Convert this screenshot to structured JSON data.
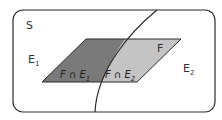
{
  "diagram": {
    "type": "venn-partition",
    "sample_space_label": "S",
    "regions": {
      "e1": {
        "label": "E",
        "subscript": "1"
      },
      "e2": {
        "label": "E",
        "subscript": "2"
      },
      "f": {
        "label": "F"
      }
    },
    "intersections": [
      {
        "label": "F ∩ E",
        "subscript": "1",
        "fill": "#7a7a7a"
      },
      {
        "label": "F ∩ E",
        "subscript": "2",
        "fill": "#c4c4c4"
      }
    ],
    "colors": {
      "border": "#2b2b2b",
      "background": "#ffffff",
      "dark_region": "#7a7a7a",
      "light_region": "#c4c4c4"
    }
  }
}
